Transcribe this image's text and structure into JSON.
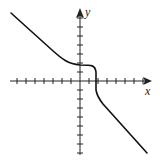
{
  "graph": {
    "x_axis_label": "x",
    "y_axis_label": "y",
    "x_ticks_left": 7,
    "x_ticks_right": 7,
    "y_ticks_up": 7,
    "y_ticks_down": 8,
    "curve_description": "Decreasing curve with horizontal inflection near (1, 2) and steep drop crossing x-axis near x = 2",
    "colors": {
      "axis": "#222222",
      "curve": "#111111",
      "background": "#ffffff"
    }
  }
}
